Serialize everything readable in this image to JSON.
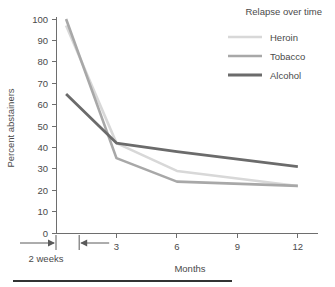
{
  "chart_data": {
    "type": "line",
    "title": "",
    "xlabel": "Months",
    "ylabel": "Percent abstainers",
    "xlim": [
      0,
      13
    ],
    "ylim": [
      0,
      100
    ],
    "grid": false,
    "legend_position": "top-right",
    "legend_title": "Relapse over time",
    "x": [
      0.5,
      3,
      6,
      12
    ],
    "x_tick_labels": [
      "3",
      "6",
      "9",
      "12"
    ],
    "x_tick_values": [
      3,
      6,
      9,
      12
    ],
    "y_tick_labels": [
      "0",
      "10",
      "20",
      "30",
      "40",
      "50",
      "60",
      "70",
      "80",
      "90",
      "100"
    ],
    "y_tick_values": [
      0,
      10,
      20,
      30,
      40,
      50,
      60,
      70,
      80,
      90,
      100
    ],
    "annotation": "2 weeks",
    "series": [
      {
        "name": "Heroin",
        "color": "#d8d8d8",
        "width": 2.6,
        "values": [
          97,
          42,
          29,
          22
        ]
      },
      {
        "name": "Tobacco",
        "color": "#a8a8a8",
        "width": 2.6,
        "values": [
          100,
          35,
          24,
          22
        ]
      },
      {
        "name": "Alcohol",
        "color": "#6b6b6b",
        "width": 2.8,
        "values": [
          65,
          42,
          38,
          31
        ]
      }
    ]
  },
  "figure": {
    "footer_rule_color": "#333333"
  }
}
